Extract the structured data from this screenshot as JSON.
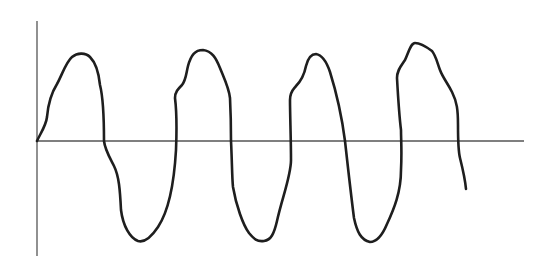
{
  "diagram": {
    "type": "hand-drawn waveform",
    "colors": {
      "background": "#ffffff",
      "axis": "#555555",
      "wave": "#1e1e1e"
    },
    "axes": {
      "y_axis": {
        "x": 37,
        "y_top": 21,
        "y_bottom": 256
      },
      "x_axis": {
        "y": 141,
        "x_start": 37,
        "x_end": 524
      }
    },
    "wave": {
      "cycles": 3.5,
      "peaks": 4,
      "troughs": 3,
      "path": "M37,141 C40,134 46,126 47,117 C48,105 52,92 57,84 C62,75 66,62 72,57 C77,53 85,52 90,57 C96,63 99,75 100,85 C103,97 104,110 104,141 C105,150 110,158 114,166 C119,176 120,190 121,210 C123,226 130,238 138,241 C145,243 152,236 158,227 C168,212 174,185 176,150 C177,125 176,106 175,98 C175,92 178,89 182,85 C186,80 186,74 188,66 C191,55 195,50 203,50 C212,51 216,58 220,68 C224,78 229,88 230,98 C231,118 231,130 231,141 C232,160 232,178 233,187 C236,205 243,225 249,233 C254,239 257,242 264,241 C271,240 274,234 277,221 C282,198 291,176 291,160 C291,140 290,115 290,100 C290,91 294,89 296,86 C300,82 304,76 306,66 C308,58 312,54 316,54 C322,55 326,60 330,72 C335,88 341,110 345,141 C348,168 351,195 354,218 C357,232 361,240 370,242 C377,242 382,236 387,224 C394,209 401,192 401,170 C402,150 401,141 401,130 C399,114 398,96 397,78 C397,70 401,66 405,60 C409,51 411,43 415,43 C420,43 428,48 432,51 C436,56 437,62 440,70 C443,78 447,82 452,92 C457,102 458,110 458,125 C458,141 458,150 460,158 C463,170 465,178 466,189"
    }
  }
}
